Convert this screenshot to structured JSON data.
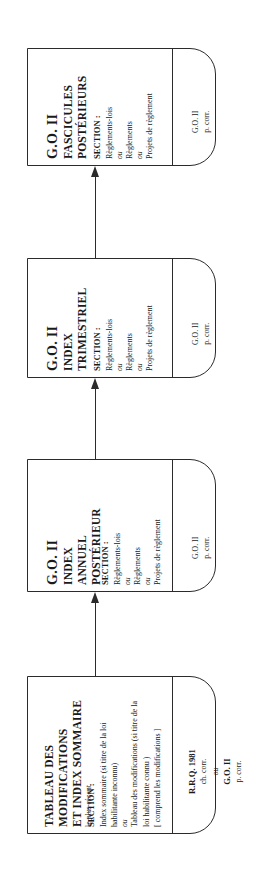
{
  "diagram": {
    "type": "flowchart",
    "orientation": "rotated-90-ccw",
    "title_text": "Cheminement de recherche reglementaire",
    "line_color": "#2b2b2b",
    "background": "#ffffff",
    "nodes": [
      {
        "id": "node-fascicules",
        "title_line1": "G.O. II",
        "title_line2": "FASCICULES",
        "title_line3": "POSTÉRIEURS",
        "subtitle": "",
        "section_heading": "SECTION :",
        "section_lines": [
          {
            "text": "Règlements-lois",
            "italic": false
          },
          {
            "text": "ou",
            "italic": true
          },
          {
            "text": "Règlements",
            "italic": false
          },
          {
            "text": "ou",
            "italic": true
          },
          {
            "text": "Projets de règlement",
            "italic": false
          }
        ],
        "footer_lines": [
          {
            "text": "G.O. II",
            "bold": false
          },
          {
            "text": "p. corr.",
            "bold": false
          }
        ]
      },
      {
        "id": "node-index-trimestriel",
        "title_line1": "G.O. II",
        "title_line2": "INDEX",
        "title_line3": "TRIMESTRIEL",
        "subtitle": "",
        "section_heading": "SECTION :",
        "section_lines": [
          {
            "text": "Règlements-lois",
            "italic": false
          },
          {
            "text": "ou",
            "italic": true
          },
          {
            "text": "Règlements",
            "italic": false
          },
          {
            "text": "ou",
            "italic": true
          },
          {
            "text": "Projets de règlement",
            "italic": false
          }
        ],
        "footer_lines": [
          {
            "text": "G.O. II",
            "bold": false
          },
          {
            "text": "p. corr.",
            "bold": false
          }
        ]
      },
      {
        "id": "node-index-annuel",
        "title_line1": "G.O. II",
        "title_line2": "INDEX",
        "title_line3": "ANNUEL",
        "title_line4": "POSTÉRIEUR",
        "subtitle": "",
        "section_heading": "SECTION :",
        "section_lines": [
          {
            "text": "Règlements-lois",
            "italic": false
          },
          {
            "text": "ou",
            "italic": true
          },
          {
            "text": "Règlements",
            "italic": false
          },
          {
            "text": "ou",
            "italic": true
          },
          {
            "text": "Projets de règlement",
            "italic": false
          }
        ],
        "footer_lines": [
          {
            "text": "G.O. II",
            "bold": false
          },
          {
            "text": "p. corr.",
            "bold": false
          }
        ]
      },
      {
        "id": "node-tableau-modifications",
        "title_line1": "TABLEAU DES",
        "title_line2": "MODIFICATIONS",
        "title_line3": "ET INDEX SOMMAIRE",
        "subtitle": "le plus récent",
        "section_heading": "SECTION :",
        "section_lines": [
          {
            "text": "Index sommaire (si titre de la loi",
            "italic": false
          },
          {
            "text": "habilitante inconnu)",
            "italic": false
          },
          {
            "text": "ou",
            "italic": true
          },
          {
            "text": "Tableau des modifications (si titre de la",
            "italic": false
          },
          {
            "text": "loi habilitante connu )",
            "italic": false
          },
          {
            "text": "[ comprend les modifications ]",
            "italic": false
          }
        ],
        "footer_lines": [
          {
            "text": "R.R.Q. 1981",
            "bold": true
          },
          {
            "text": "ch. corr.",
            "bold": false
          },
          {
            "text": "ou",
            "italic": true
          },
          {
            "text": "G.O. II",
            "bold": true
          },
          {
            "text": "p. corr.",
            "bold": false
          }
        ]
      }
    ],
    "connectors": [
      {
        "id": "arrow-1",
        "from": "node-index-trimestriel",
        "to": "node-fascicules",
        "direction": "up"
      },
      {
        "id": "arrow-2",
        "from": "node-index-annuel",
        "to": "node-index-trimestriel",
        "direction": "up"
      },
      {
        "id": "arrow-3",
        "from": "node-tableau-modifications",
        "to": "node-index-annuel",
        "direction": "up"
      }
    ]
  }
}
